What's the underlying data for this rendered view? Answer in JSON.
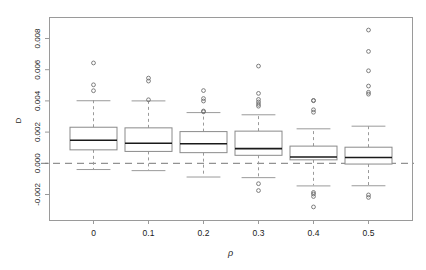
{
  "chart": {
    "type": "boxplot",
    "title": "",
    "xlabel": "ρ",
    "ylabel": "D",
    "y_ticks": [
      "0.008",
      "0.006",
      "0.004",
      "0.002",
      "0.000",
      "-0.002"
    ],
    "y_tick_values": [
      0.008,
      0.006,
      0.004,
      0.002,
      0.0,
      -0.002
    ],
    "x_ticks": [
      "0",
      "0.1",
      "0.2",
      "0.3",
      "0.4",
      "0.5"
    ],
    "ylim": [
      -0.0031,
      0.00895
    ],
    "grid": false,
    "legend": false,
    "reference_line": {
      "y": 0.0,
      "style": "dashed",
      "color": "#777777"
    },
    "frame_color": "#9a9a9a",
    "box_color": "#8a8a8a",
    "median_color": "#1a1a1a",
    "whisker_color": "#9a9a9a",
    "outlier_color": "#707070"
  },
  "chart_data": {
    "type": "boxplot",
    "title": "",
    "xlabel": "ρ",
    "ylabel": "D",
    "categories": [
      "0",
      "0.1",
      "0.2",
      "0.3",
      "0.4",
      "0.5"
    ],
    "ylim": [
      -0.0031,
      0.00895
    ],
    "yticks": [
      -0.002,
      0.0,
      0.002,
      0.004,
      0.006,
      0.008
    ],
    "grid": false,
    "legend_position": "none",
    "reference_line_y": 0.0,
    "boxes": [
      {
        "category": "0",
        "q1": 0.00083,
        "median": 0.00148,
        "q3": 0.00228,
        "whisker_low": -0.0004,
        "whisker_high": 0.00401,
        "outliers": [
          0.0064,
          0.005,
          0.00462
        ]
      },
      {
        "category": "0.1",
        "q1": 0.00073,
        "median": 0.00129,
        "q3": 0.00224,
        "whisker_low": -0.00047,
        "whisker_high": 0.004,
        "outliers": [
          0.00543,
          0.00524,
          0.00404
        ]
      },
      {
        "category": "0.2",
        "q1": 0.00065,
        "median": 0.00125,
        "q3": 0.002,
        "whisker_low": -0.00088,
        "whisker_high": 0.00325,
        "outliers": [
          0.00463,
          0.00412,
          0.00396,
          0.00332,
          0.00327
        ]
      },
      {
        "category": "0.3",
        "q1": 0.00048,
        "median": 0.00094,
        "q3": 0.00203,
        "whisker_low": -0.00092,
        "whisker_high": 0.00311,
        "outliers": [
          0.0062,
          0.00445,
          0.00406,
          0.0039,
          0.00375,
          0.00363,
          -0.00134,
          -0.00178
        ]
      },
      {
        "category": "0.4",
        "q1": 0.00019,
        "median": 0.0004,
        "q3": 0.00107,
        "whisker_low": -0.00145,
        "whisker_high": 0.00221,
        "outliers": [
          0.004,
          0.00398,
          0.0034,
          0.00324,
          -0.0019,
          -0.002,
          -0.00216,
          -0.00283
        ]
      },
      {
        "category": "0.5",
        "q1": -8e-05,
        "median": 0.00037,
        "q3": 0.001,
        "whisker_low": -0.00144,
        "whisker_high": 0.00238,
        "outliers": [
          0.00851,
          0.00714,
          0.0059,
          0.00492,
          0.00452,
          0.0044,
          -0.00206,
          -0.00222
        ]
      }
    ]
  }
}
